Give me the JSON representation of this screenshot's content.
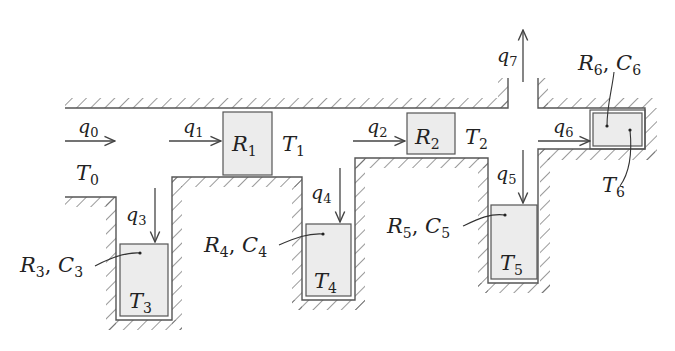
{
  "diagram": {
    "type": "thermal-network-schematic",
    "flows": [
      {
        "id": "q0",
        "label": "q",
        "sub": "0",
        "direction": "right"
      },
      {
        "id": "q1",
        "label": "q",
        "sub": "1",
        "direction": "right"
      },
      {
        "id": "q2",
        "label": "q",
        "sub": "2",
        "direction": "right"
      },
      {
        "id": "q3",
        "label": "q",
        "sub": "3",
        "direction": "down"
      },
      {
        "id": "q4",
        "label": "q",
        "sub": "4",
        "direction": "down"
      },
      {
        "id": "q5",
        "label": "q",
        "sub": "5",
        "direction": "down"
      },
      {
        "id": "q6",
        "label": "q",
        "sub": "6",
        "direction": "right"
      },
      {
        "id": "q7",
        "label": "q",
        "sub": "7",
        "direction": "up"
      }
    ],
    "temperatures": [
      {
        "id": "T0",
        "label": "T",
        "sub": "0"
      },
      {
        "id": "T1",
        "label": "T",
        "sub": "1"
      },
      {
        "id": "T2",
        "label": "T",
        "sub": "2"
      },
      {
        "id": "T3",
        "label": "T",
        "sub": "3"
      },
      {
        "id": "T4",
        "label": "T",
        "sub": "4"
      },
      {
        "id": "T5",
        "label": "T",
        "sub": "5"
      },
      {
        "id": "T6",
        "label": "T",
        "sub": "6"
      }
    ],
    "resistors": [
      {
        "id": "R1",
        "label": "R",
        "sub": "1"
      },
      {
        "id": "R2",
        "label": "R",
        "sub": "2"
      }
    ],
    "rc_labels": [
      {
        "id": "RC3",
        "r": "R",
        "r_sub": "3",
        "sep": ", ",
        "c": "C",
        "c_sub": "3"
      },
      {
        "id": "RC4",
        "r": "R",
        "r_sub": "4",
        "sep": ", ",
        "c": "C",
        "c_sub": "4"
      },
      {
        "id": "RC5",
        "r": "R",
        "r_sub": "5",
        "sep": ", ",
        "c": "C",
        "c_sub": "5"
      },
      {
        "id": "RC6",
        "r": "R",
        "r_sub": "6",
        "sep": ", ",
        "c": "C",
        "c_sub": "6"
      }
    ]
  },
  "colors": {
    "wall": "#555555",
    "box_fill": "#ececec",
    "text": "#222222"
  }
}
